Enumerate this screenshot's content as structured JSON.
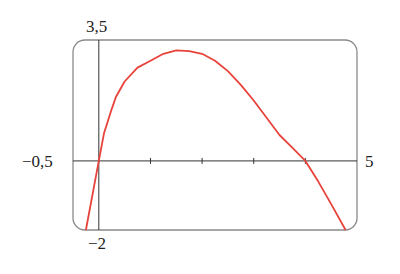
{
  "chart_data": {
    "type": "line",
    "title": "",
    "xlabel": "",
    "ylabel": "",
    "xlim": [
      -0.5,
      5
    ],
    "ylim": [
      -2,
      3.5
    ],
    "grid": false,
    "legend": null,
    "frame": "rounded-rectangle",
    "x_ticks": [
      1,
      2,
      3,
      4
    ],
    "range_labels": {
      "x_min": "−0,5",
      "x_max": "5",
      "y_max": "3,5",
      "y_min": "−2"
    },
    "series": [
      {
        "name": "f(x)",
        "color": "#e8433a",
        "x": [
          -0.25,
          0,
          0.1,
          0.25,
          0.33,
          0.5,
          0.75,
          1,
          1.25,
          1.5,
          1.75,
          2,
          2.25,
          2.5,
          2.75,
          3,
          3.25,
          3.5,
          3.75,
          4,
          4.25,
          4.5,
          4.78
        ],
        "y": [
          -2,
          0,
          0.8,
          1.5,
          1.85,
          2.3,
          2.7,
          2.9,
          3.1,
          3.2,
          3.18,
          3.1,
          2.9,
          2.6,
          2.2,
          1.75,
          1.25,
          0.75,
          0.38,
          0,
          -0.6,
          -1.25,
          -2
        ]
      }
    ]
  },
  "colors": {
    "curve": "#e8433a",
    "frame": "#8a8a8a",
    "axis": "#333333"
  }
}
